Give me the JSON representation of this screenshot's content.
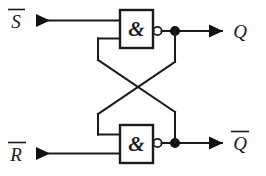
{
  "diagram": {
    "background_color": "#fefefe",
    "line_color": "#1b1b1b",
    "inputs": [
      {
        "id": "input-s-bar",
        "label": "S",
        "overbar": true,
        "label_text": "S̅",
        "marker": "solid-arrowhead",
        "position": "top-left"
      },
      {
        "id": "input-r-bar",
        "label": "R",
        "overbar": true,
        "label_text": "R̅",
        "marker": "solid-arrowhead",
        "position": "bottom-left"
      }
    ],
    "gates": [
      {
        "id": "gate-top",
        "symbol": "&",
        "type": "NAND",
        "inverted_output": true,
        "inputs": [
          "S̅",
          "Q̅ feedback"
        ],
        "output": "Q"
      },
      {
        "id": "gate-bottom",
        "symbol": "&",
        "type": "NAND",
        "inverted_output": true,
        "inputs": [
          "Q feedback",
          "R̅"
        ],
        "output": "Q̅"
      }
    ],
    "outputs": [
      {
        "id": "output-q",
        "label": "Q",
        "overbar": false,
        "label_text": "Q",
        "marker": "solid-arrowhead",
        "position": "top-right"
      },
      {
        "id": "output-q-bar",
        "label": "Q",
        "overbar": true,
        "label_text": "Q̅",
        "marker": "solid-arrowhead",
        "position": "bottom-right"
      }
    ],
    "junctions": [
      {
        "id": "junction-top",
        "x": 175,
        "y": 31
      },
      {
        "id": "junction-bottom",
        "x": 175,
        "y": 143
      }
    ]
  }
}
